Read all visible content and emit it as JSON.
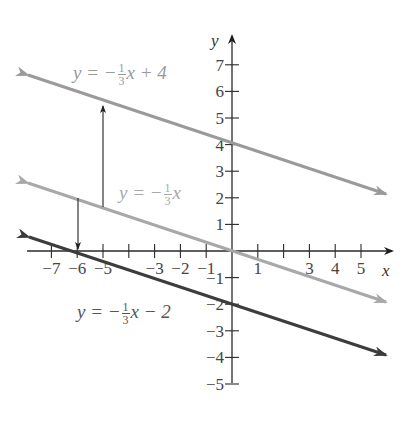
{
  "chart_data": {
    "type": "line",
    "title": "",
    "xlabel": "x",
    "ylabel": "y",
    "xlim": [
      -7.5,
      6
    ],
    "ylim": [
      -6,
      8
    ],
    "grid": false,
    "x_ticks": [
      -7,
      -6,
      -5,
      -4,
      -3,
      -2,
      -1,
      1,
      2,
      3,
      4,
      5
    ],
    "x_tick_labels": [
      "−7",
      "−6",
      "−5",
      "",
      "−3",
      "−2",
      "−1",
      "1",
      "",
      "3",
      "4",
      "5"
    ],
    "y_ticks": [
      7,
      6,
      5,
      4,
      3,
      2,
      1,
      -1,
      -2,
      -3,
      -4,
      -5
    ],
    "y_tick_labels": [
      "7",
      "6",
      "5",
      "4",
      "3",
      "2",
      "1",
      "−1",
      "−2",
      "−3",
      "−4",
      "−5"
    ],
    "series": [
      {
        "name": "y = -1/3 x + 4",
        "slope": -0.3333,
        "intercept": 4,
        "color": "#9a9a9a",
        "x": [
          -7.9,
          6.0
        ],
        "y": [
          6.63,
          2.0
        ]
      },
      {
        "name": "y = -1/3 x",
        "slope": -0.3333,
        "intercept": 0,
        "color": "#a8a8a8",
        "x": [
          -7.9,
          6.0
        ],
        "y": [
          2.63,
          -2.0
        ]
      },
      {
        "name": "y = -1/3 x - 2",
        "slope": -0.3333,
        "intercept": -2,
        "color": "#3c3c3c",
        "x": [
          -7.8,
          6.0
        ],
        "y": [
          0.6,
          -4.0
        ]
      }
    ],
    "annotations": [
      {
        "type": "arrow",
        "direction": "up",
        "x": -5,
        "from_y": 1.67,
        "to_y": 5.67,
        "note": "shift up 4 units"
      },
      {
        "type": "arrow",
        "direction": "down",
        "x": -6,
        "from_y": 2,
        "to_y": 0,
        "note": "shift down 2 units"
      }
    ]
  },
  "labels": {
    "axis_x": "x",
    "axis_y": "y",
    "eq_top": {
      "prefix": "y = −",
      "num": "1",
      "den": "3",
      "suffix": "x + 4"
    },
    "eq_mid": {
      "prefix": "y = −",
      "num": "1",
      "den": "3",
      "suffix": "x"
    },
    "eq_bot": {
      "prefix": "y = −",
      "num": "1",
      "den": "3",
      "suffix": "x − 2"
    }
  },
  "colors": {
    "axis": "#2a2a2a",
    "line_top": "#9a9a9a",
    "line_mid": "#a8a8a8",
    "line_bot": "#3c3c3c",
    "label_gray": "#9a9a9a",
    "label_dark": "#555555",
    "tick_label": "#444444"
  }
}
